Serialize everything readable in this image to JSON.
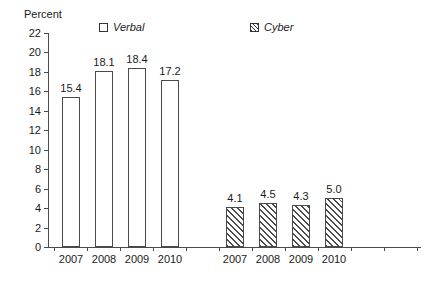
{
  "chart_data": {
    "type": "bar",
    "title": "",
    "subtitle": "",
    "xlabel": "",
    "ylabel": "Percent",
    "ylim": [
      0,
      22
    ],
    "ytick_step": 2,
    "yticks": [
      0,
      2,
      4,
      6,
      8,
      10,
      12,
      14,
      16,
      18,
      20,
      22
    ],
    "grid": false,
    "legend_position": "top",
    "groups": [
      {
        "name": "Verbal",
        "style": "open",
        "categories": [
          "2007",
          "2008",
          "2009",
          "2010"
        ],
        "values": [
          15.4,
          18.1,
          18.4,
          17.2
        ],
        "value_labels": [
          "15.4",
          "18.1",
          "18.4",
          "17.2"
        ]
      },
      {
        "name": "Cyber",
        "style": "hatched",
        "categories": [
          "2007",
          "2008",
          "2009",
          "2010"
        ],
        "values": [
          4.1,
          4.5,
          4.3,
          5.0
        ],
        "value_labels": [
          "4.1",
          "4.5",
          "4.3",
          "5.0"
        ]
      }
    ],
    "series": [
      {
        "name": "Verbal",
        "categories": [
          "2007",
          "2008",
          "2009",
          "2010"
        ],
        "values": [
          15.4,
          18.1,
          18.4,
          17.2
        ]
      },
      {
        "name": "Cyber",
        "categories": [
          "2007",
          "2008",
          "2009",
          "2010"
        ],
        "values": [
          4.1,
          4.5,
          4.3,
          5.0
        ]
      }
    ],
    "legend": [
      {
        "label": "Verbal",
        "marker": "open-square"
      },
      {
        "label": "Cyber",
        "marker": "hatched-square"
      }
    ],
    "colors": {
      "axis": "#4a4a4a",
      "text": "#1a1a1a",
      "bar_fill": "#ffffff",
      "bar_stroke": "#4a4a4a",
      "hatch": "#4a4a4a",
      "background": "#ffffff"
    }
  }
}
